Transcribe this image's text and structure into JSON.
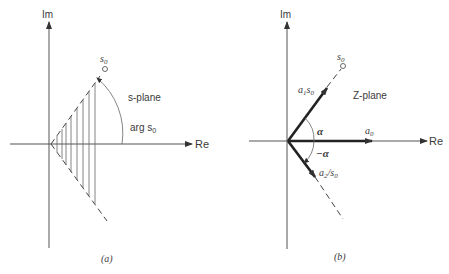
{
  "panel_a": {
    "im_label": "Im",
    "re_label": "Re",
    "point_label": "s",
    "point_sub": "0",
    "plane_label": "s-plane",
    "arg_label": "arg s",
    "arg_sub": "0",
    "caption": "(a)"
  },
  "panel_b": {
    "im_label": "Im",
    "re_label": "Re",
    "point_label": "s",
    "point_sub": "0",
    "plane_label": "Z-plane",
    "vec1_label": "a",
    "vec1_sub": "1",
    "vec1_tail": "s",
    "vec1_tail_sub": "0",
    "vec0_label": "a",
    "vec0_sub": "0",
    "vec2_label": "a",
    "vec2_sub": "2",
    "vec2_tail": "/s",
    "vec2_tail_sub": "0",
    "alpha_label": "α",
    "neg_alpha_label": "−α",
    "caption": "(b)"
  }
}
